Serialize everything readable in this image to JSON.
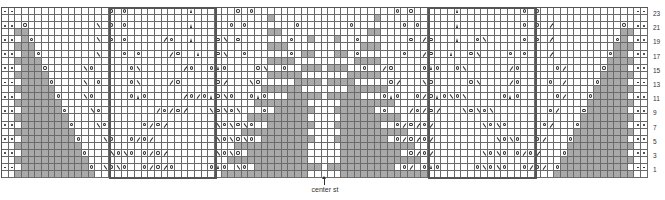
{
  "chart_data": {
    "type": "table",
    "columns": 97,
    "rows_count": 24,
    "center_column_index": 48,
    "row_numbers": [
      "23",
      "21",
      "19",
      "17",
      "15",
      "13",
      "11",
      "9",
      "7",
      "5",
      "3",
      "1"
    ],
    "annotation": "center st",
    "legend_codes": {
      ".": "knit (empty square)",
      "g": "no stitch (gray)",
      "d": "purl (dot)",
      "o": "yarn over",
      "/": "k2tog",
      "\\": "ssk",
      "^": "centered double decrease"
    },
    "pattern_repeat_boxes": [
      {
        "start_col": 16,
        "end_col": 32
      },
      {
        "start_col": 64,
        "end_col": 80
      }
    ],
    "left_half_rows": [
      "dd..............o.o.........^......o.o.........",
      "........................................g......",
      "dd.o..........\\.o.o.........^.....o.o.......o..",
      "..gg....................................gg.....",
      "dd.go.........\\.o.o...../o..^...o\\.o.......o..g",
      "..ggg...................................ggg....",
      "dd.ggo........\\...o.o..../o..^..o\\..o......o.gg",
      "..gggg..................................gggg...",
      "dd.gggo.....\\o.....o\\....../o..o^o....o\\..o..ggg",
      "..ggggg.................................ggggg..",
      "dd.ggggo....\\.o....o\\..../o.....o/...\\o.....gggg",
      "..gggggg...............................gggggg..",
      "dd.gggggo...\\o.....o^o...../o/o^o\\o..o^o...ggggg",
      "..ggggggg.............................gggggggg.",
      "dd.ggggggo...\\o......../o/o/...\\o\\o\\...o.gggggg",
      "..gggggggg...........................ggggggggg.",
      "dd.gggggggo...\\o.....o/o/.......\\o\\o\\o..ggggggg",
      "..ggggggggg.........................gggggggggg.",
      "dd.ggggggggo...\\o..o/o/.........\\o\\o\\o.gggggggg",
      "..gggggggggg.......................ggggggggggg.",
      "dd.gggggggggo...\\o\\o.o/o/.......\\o\\o.ggggggggg",
      "..ggggggggggg.....................gggggggggggg.",
      "dd.ggggggggggo.\\o\\o..o/o/o.....o^o.\\o.gggggggggg",
      "..gggggggggggg...................ggggggggggggg."
    ]
  },
  "labels": {
    "center": "center st"
  }
}
